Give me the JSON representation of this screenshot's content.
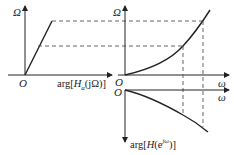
{
  "diagram": {
    "left_panel": {
      "y_axis_label": "Ω",
      "origin_label": "O",
      "x_axis_label_prefix": "arg[",
      "x_axis_label_H": "H",
      "x_axis_label_sub": "a",
      "x_axis_label_arg": "(jΩ)]"
    },
    "right_upper_panel": {
      "y_axis_label": "Ω",
      "origin_label": "O",
      "x_axis_label": "ω"
    },
    "right_lower_panel": {
      "origin_label": "O",
      "x_axis_label": "ω",
      "y_axis_label_prefix": "arg[",
      "y_axis_label_H": "H",
      "y_axis_label_arg": "(e",
      "y_axis_label_sup": "jω",
      "y_axis_label_suffix": ")]"
    },
    "colors": {
      "line": "#222222",
      "dashed": "#555555"
    }
  }
}
